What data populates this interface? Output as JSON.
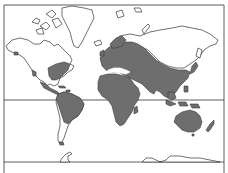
{
  "map": {
    "projection": "Mercator world map",
    "title": "",
    "colors": {
      "background": "#ffffff",
      "land_outline": "#333333",
      "distribution_fill": "#6e6e6e",
      "frame": "#333333"
    },
    "lines": {
      "equator": "equator line",
      "bottom_boundary": "southern boundary line"
    },
    "shaded_regions": [
      "Eastern United States",
      "Mexico and Central America",
      "Caribbean",
      "Northern South America",
      "Europe",
      "Africa",
      "Madagascar",
      "Middle East",
      "Central and Southern Russia / Siberia",
      "South Asia",
      "Southeast Asia",
      "Eastern China",
      "Japan",
      "Indonesia and New Guinea",
      "Australia",
      "New Zealand"
    ],
    "unshaded_regions": [
      "Canada and Alaska",
      "Greenland",
      "Arctic islands",
      "Northern Siberia",
      "Southern South America",
      "Antarctica"
    ]
  }
}
